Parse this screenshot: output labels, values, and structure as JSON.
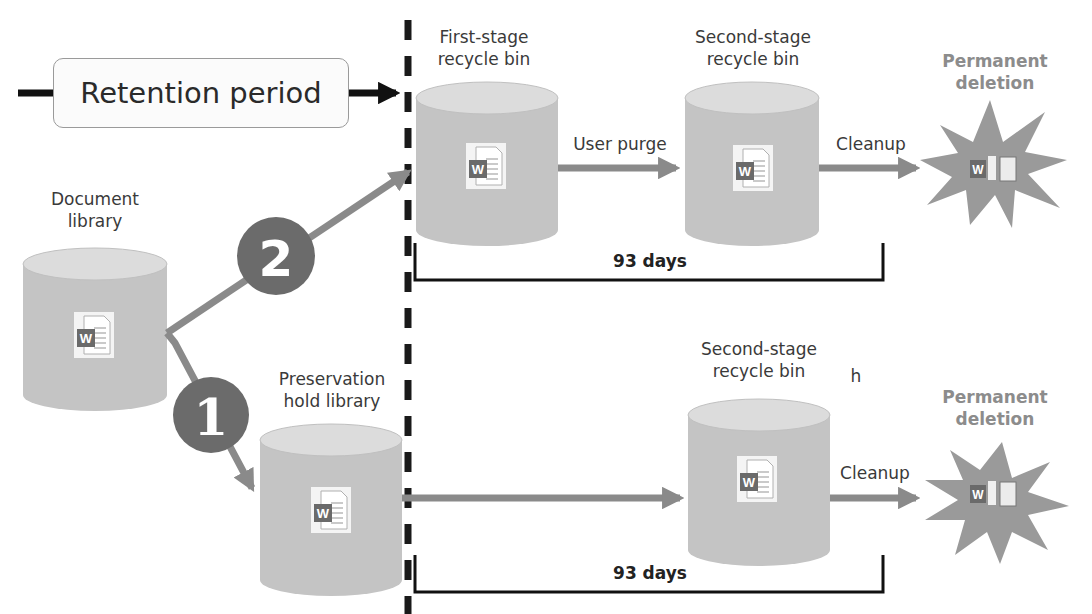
{
  "diagram": {
    "colors": {
      "cylinder_body": "#c4c4c4",
      "cylinder_top": "#dcdcdc",
      "arrow": "#8a8a8a",
      "badge": "#6b6b6b",
      "starburst": "#9a9a9a",
      "dash_line": "#1a1a1a",
      "perm_text": "#8c8c8c",
      "word_icon": "#6a6a6a"
    },
    "retention": {
      "label": "Retention period"
    },
    "nodes": {
      "document_library": {
        "label_line1": "Document",
        "label_line2": "library"
      },
      "first_stage_bin": {
        "label_line1": "First-stage",
        "label_line2": "recycle bin"
      },
      "second_stage_bin_top": {
        "label_line1": "Second-stage",
        "label_line2": "recycle bin"
      },
      "preservation_hold": {
        "label_line1": "Preservation",
        "label_line2": "hold library"
      },
      "second_stage_bin_bottom": {
        "label_line1": "Second-stage",
        "label_line2": "recycle bin",
        "stray": "h"
      },
      "perm_top": {
        "label_line1": "Permanent",
        "label_line2": "deletion"
      },
      "perm_bottom": {
        "label_line1": "Permanent",
        "label_line2": "deletion"
      }
    },
    "edges": {
      "user_purge": "User purge",
      "cleanup_top": "Cleanup",
      "cleanup_bottom": "Cleanup"
    },
    "badges": {
      "path1": "1",
      "path2": "2"
    },
    "durations": {
      "top": "93 days",
      "bottom": "93 days"
    },
    "icons": {
      "document": "word-document-icon",
      "deleted": "torn-word-document-icon"
    }
  }
}
